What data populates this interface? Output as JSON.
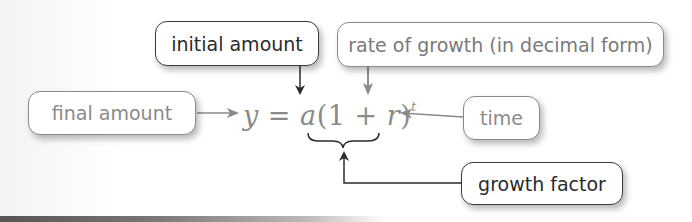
{
  "diagram": {
    "equation": {
      "lhs": "y",
      "equals": "=",
      "a": "a",
      "open_paren": "(",
      "one": "1",
      "plus": "+",
      "r": "r",
      "close_paren": ")",
      "exponent": "t"
    },
    "labels": {
      "initial_amount": "initial amount",
      "rate_of_growth": "rate of growth (in decimal form)",
      "final_amount": "final amount",
      "time": "time",
      "growth_factor": "growth factor"
    },
    "colors": {
      "dark_text": "#2b2b2b",
      "light_text": "#8a8a8a",
      "arrow_dark": "#2b2b2b",
      "arrow_light": "#8a8a8a"
    }
  }
}
